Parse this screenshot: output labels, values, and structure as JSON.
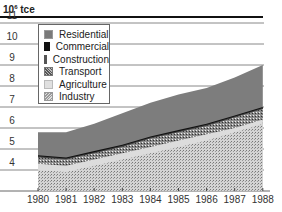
{
  "chart_data": {
    "type": "area",
    "title": "",
    "unit_label": "10⁶ tce",
    "unit_base": "10",
    "unit_exp": "6",
    "unit_suffix": " tce",
    "xlabel": "",
    "ylabel": "10^6 tce",
    "x": [
      "1980",
      "1981",
      "1982",
      "1983",
      "1984",
      "1985",
      "1986",
      "1987",
      "1988"
    ],
    "yticks": [
      "11",
      "10",
      "9",
      "8",
      "7",
      "6",
      "5",
      "4"
    ],
    "ylim": [
      3,
      11.5
    ],
    "grid": true,
    "legend_position": "upper-left inset",
    "stack_tops": {
      "Industry": [
        4.0,
        3.9,
        4.2,
        4.5,
        4.8,
        5.1,
        5.4,
        5.8,
        6.2
      ],
      "Agriculture": [
        4.3,
        4.2,
        4.5,
        4.8,
        5.1,
        5.4,
        5.7,
        6.0,
        6.4
      ],
      "Transport": [
        4.6,
        4.5,
        4.8,
        5.1,
        5.5,
        5.8,
        6.1,
        6.5,
        6.9
      ],
      "Construction": [
        4.65,
        4.55,
        4.85,
        5.15,
        5.55,
        5.85,
        6.15,
        6.55,
        6.95
      ],
      "Commercial": [
        4.7,
        4.6,
        4.9,
        5.2,
        5.6,
        5.9,
        6.2,
        6.6,
        7.0
      ],
      "Residential": [
        5.8,
        5.8,
        6.2,
        6.7,
        7.2,
        7.6,
        7.9,
        8.4,
        9.0
      ]
    },
    "series": [
      {
        "name": "Residential",
        "color": "#7a7a7a",
        "pattern": "solid"
      },
      {
        "name": "Commercial",
        "color": "#111111",
        "pattern": "solid"
      },
      {
        "name": "Construction",
        "color": "#555555",
        "pattern": "solid"
      },
      {
        "name": "Transport",
        "color": "#9a9a9a",
        "pattern": "dense-dots"
      },
      {
        "name": "Agriculture",
        "color": "#d8d8d8",
        "pattern": "solid"
      },
      {
        "name": "Industry",
        "color": "#c4c4c4",
        "pattern": "fine-dots"
      }
    ]
  },
  "legend": {
    "items": [
      "Residential",
      "Commercial",
      "Construction",
      "Transport",
      "Agriculture",
      "Industry"
    ]
  }
}
